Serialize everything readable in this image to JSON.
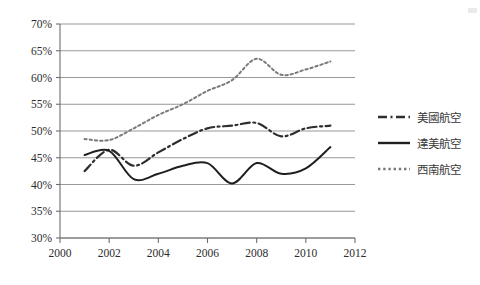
{
  "chart_data": {
    "type": "line",
    "title": "",
    "subtitle": "",
    "xlabel": "",
    "ylabel": "",
    "xlim": [
      2000,
      2012
    ],
    "ylim": [
      0.3,
      0.7
    ],
    "x_ticks": [
      "2000",
      "2002",
      "2004",
      "2006",
      "2008",
      "2010",
      "2012"
    ],
    "x_tick_values": [
      2000,
      2002,
      2004,
      2006,
      2008,
      2010,
      2012
    ],
    "y_ticks": [
      "30%",
      "35%",
      "40%",
      "45%",
      "50%",
      "55%",
      "60%",
      "65%",
      "70%"
    ],
    "y_tick_values": [
      0.3,
      0.35,
      0.4,
      0.45,
      0.5,
      0.55,
      0.6,
      0.65,
      0.7
    ],
    "grid": "horizontal",
    "legend_position": "right",
    "x": [
      2001,
      2002,
      2003,
      2004,
      2005,
      2006,
      2007,
      2008,
      2009,
      2010,
      2011
    ],
    "series": [
      {
        "name": "美國航空",
        "style": "dash-dot",
        "color": "#2e2e2e",
        "values": [
          42.5,
          46.5,
          43.5,
          46.0,
          48.5,
          50.5,
          51.0,
          51.5,
          49.0,
          50.5,
          51.0
        ]
      },
      {
        "name": "達美航空",
        "style": "solid",
        "color": "#1f1f1f",
        "values": [
          45.5,
          46.3,
          41.0,
          42.0,
          43.5,
          44.0,
          40.2,
          44.0,
          42.0,
          43.0,
          47.0
        ]
      },
      {
        "name": "西南航空",
        "style": "dotted",
        "color": "#7a7a7a",
        "values": [
          48.5,
          48.3,
          50.5,
          53.0,
          55.0,
          57.5,
          59.5,
          63.5,
          60.5,
          61.5,
          63.0
        ]
      }
    ]
  },
  "legend": {
    "items": [
      {
        "label": "美國航空",
        "swatch": "dash-dot-swatch"
      },
      {
        "label": "達美航空",
        "swatch": "solid-swatch"
      },
      {
        "label": "西南航空",
        "swatch": "dotted-swatch"
      }
    ]
  }
}
